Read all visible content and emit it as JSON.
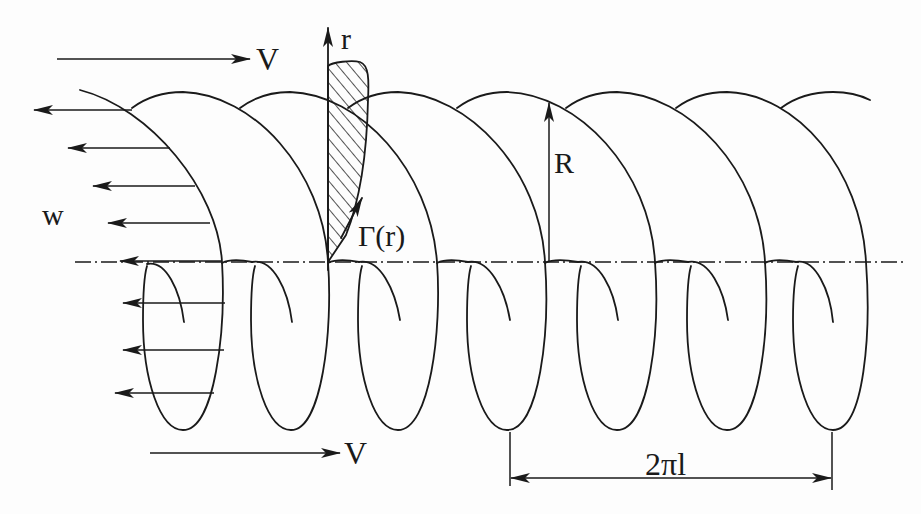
{
  "figure": {
    "background": "#ffffff",
    "ink_color": "#1a1a1a"
  },
  "labels": {
    "freestream_top": "V",
    "freestream_bottom": "V",
    "induced_velocity": "w",
    "radial_coordinate": "r",
    "wake_radius": "R",
    "circulation": "Γ(r)",
    "helix_pitch": "2πl"
  },
  "geometry": {
    "axis_y": 262,
    "loop_bottom_x": [
      183,
      291,
      398,
      507,
      617,
      727,
      833
    ],
    "induced_velocity_arrow_count": 8,
    "pitch_span_x": [
      510,
      832
    ]
  }
}
